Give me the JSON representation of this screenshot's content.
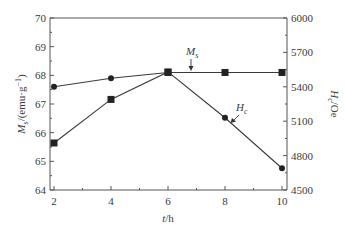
{
  "chart_data": {
    "type": "line",
    "title": "",
    "xlabel": "t/h",
    "x": [
      2,
      4,
      6,
      8,
      10
    ],
    "x_ticks": [
      2,
      4,
      6,
      8,
      10
    ],
    "xlim": [
      2,
      10
    ],
    "ylabel_left": "Ms/(emu·g⁻¹)",
    "ylim_left": [
      64,
      70
    ],
    "yticks_left": [
      64,
      65,
      66,
      67,
      68,
      69,
      70
    ],
    "ylabel_right": "Hc/Oe",
    "ylim_right": [
      4500,
      6000
    ],
    "yticks_right": [
      4500,
      4800,
      5100,
      5400,
      5700,
      6000
    ],
    "grid": false,
    "series": [
      {
        "name": "Ms",
        "axis": "left",
        "values": [
          67.6,
          67.9,
          68.1,
          68.1,
          68.1
        ],
        "markers": [
          "circle",
          "circle",
          "square",
          "square",
          "square"
        ]
      },
      {
        "name": "Hc",
        "axis": "right",
        "values": [
          4910,
          5290,
          5530,
          5130,
          4690
        ],
        "markers": [
          "square",
          "square",
          "square",
          "circle",
          "circle"
        ]
      }
    ],
    "annotations": [
      {
        "text_main": "M",
        "text_sub": "s",
        "points_to": "Ms",
        "x": 7,
        "arrow": "down"
      },
      {
        "text_main": "H",
        "text_sub": "c",
        "points_to": "Hc",
        "x": 8.2,
        "arrow": "down-left"
      }
    ]
  },
  "labels": {
    "xlabel_main": "t",
    "xlabel_unit": "/h",
    "ylabel_left_main": "M",
    "ylabel_left_sub": "s",
    "ylabel_left_unit": "/(emu·g",
    "ylabel_left_sup": "−1",
    "ylabel_left_close": ")",
    "ylabel_right_main": "H",
    "ylabel_right_sub": "c",
    "ylabel_right_unit": "/Oe",
    "anno_ms_main": "M",
    "anno_ms_sub": "s",
    "anno_hc_main": "H",
    "anno_hc_sub": "c"
  }
}
